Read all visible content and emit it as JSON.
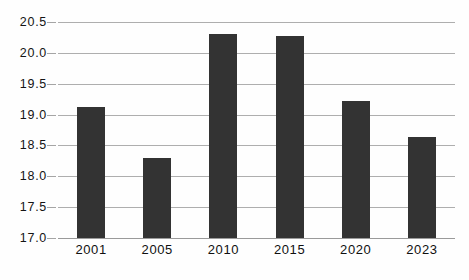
{
  "chart_data": {
    "type": "bar",
    "title": "",
    "subtitle": "",
    "xlabel": "",
    "ylabel": "",
    "categories": [
      "2001",
      "2005",
      "2010",
      "2015",
      "2020",
      "2023"
    ],
    "values": [
      19.12,
      18.3,
      20.31,
      20.27,
      19.22,
      18.63
    ],
    "series": [
      {
        "name": "",
        "values": [
          19.12,
          18.3,
          20.31,
          20.27,
          19.22,
          18.63
        ]
      }
    ],
    "ylim": [
      17.0,
      20.5
    ],
    "ytick_labels": [
      "17.0",
      "17.5",
      "18.0",
      "18.5",
      "19.0",
      "19.5",
      "20.0",
      "20.5"
    ],
    "ytick_values": [
      17.0,
      17.5,
      18.0,
      18.5,
      19.0,
      19.5,
      20.0,
      20.5
    ],
    "xtick_labels": [
      "2001",
      "2005",
      "2010",
      "2015",
      "2020",
      "2023"
    ],
    "grid": true,
    "legend": false,
    "legend_position": "none",
    "bar_color": "#333333",
    "gridline_color": "#aeaeae",
    "background_color": "#fefefe",
    "text_color": "#111111"
  }
}
